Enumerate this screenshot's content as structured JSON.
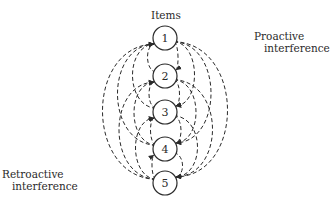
{
  "title": "Items",
  "labels": {
    "proactive_line1": "Proactive",
    "proactive_line2": "interference",
    "retroactive_line1": "Retroactive",
    "retroactive_line2": "interference"
  },
  "items": [
    {
      "id": 1,
      "label": "1"
    },
    {
      "id": 2,
      "label": "2"
    },
    {
      "id": 3,
      "label": "3"
    },
    {
      "id": 4,
      "label": "4"
    },
    {
      "id": 5,
      "label": "5"
    }
  ],
  "edges": {
    "proactive": [
      [
        1,
        2
      ],
      [
        1,
        3
      ],
      [
        1,
        4
      ],
      [
        1,
        5
      ],
      [
        2,
        3
      ],
      [
        2,
        4
      ],
      [
        2,
        5
      ],
      [
        3,
        4
      ],
      [
        3,
        5
      ],
      [
        4,
        5
      ]
    ],
    "retroactive": [
      [
        2,
        1
      ],
      [
        3,
        1
      ],
      [
        4,
        1
      ],
      [
        5,
        1
      ],
      [
        3,
        2
      ],
      [
        4,
        2
      ],
      [
        5,
        2
      ],
      [
        4,
        3
      ],
      [
        5,
        3
      ],
      [
        5,
        4
      ]
    ]
  },
  "colors": {
    "stroke": "#2a2a2a",
    "background": "#ffffff"
  }
}
